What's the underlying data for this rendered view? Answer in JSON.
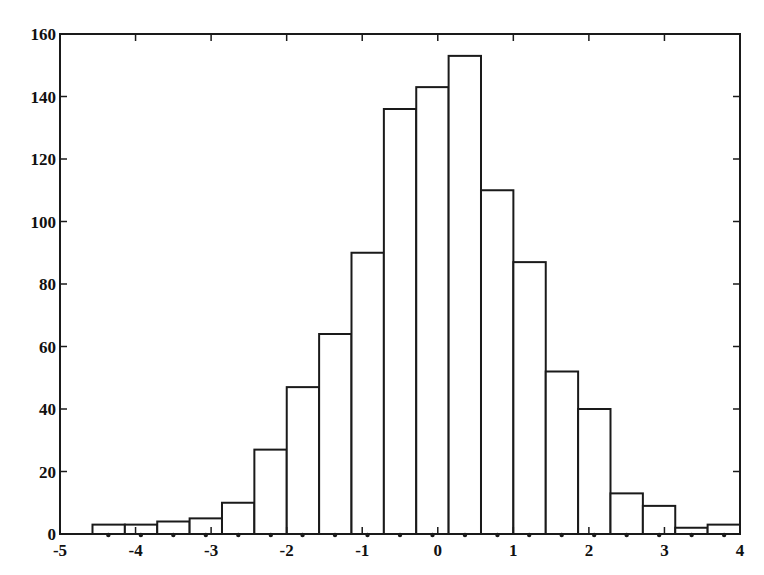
{
  "chart_data": {
    "type": "bar",
    "subtype": "histogram",
    "title": "",
    "xlabel": "",
    "ylabel": "",
    "xlim": [
      -5,
      4
    ],
    "ylim": [
      0,
      160
    ],
    "grid": false,
    "legend": null,
    "bin_start": -4.57,
    "bin_width": 0.4285,
    "bin_centers": [
      -4.36,
      -3.93,
      -3.5,
      -3.07,
      -2.64,
      -2.21,
      -1.79,
      -1.36,
      -0.93,
      -0.5,
      -0.07,
      0.36,
      0.79,
      1.21,
      1.64,
      2.07,
      2.5,
      2.93,
      3.36,
      3.79
    ],
    "values": [
      3,
      3,
      4,
      5,
      10,
      27,
      47,
      64,
      90,
      136,
      143,
      153,
      110,
      87,
      52,
      40,
      13,
      9,
      2,
      3
    ],
    "x_ticks": [
      "-5",
      "-4",
      "-3",
      "-2",
      "-1",
      "0",
      "1",
      "2",
      "3",
      "4"
    ],
    "x_tick_values": [
      -5,
      -4,
      -3,
      -2,
      -1,
      0,
      1,
      2,
      3,
      4
    ],
    "y_ticks": [
      "0",
      "20",
      "40",
      "60",
      "80",
      "100",
      "120",
      "140",
      "160"
    ],
    "y_tick_values": [
      0,
      20,
      40,
      60,
      80,
      100,
      120,
      140,
      160
    ],
    "bar_fill": "#ffffff",
    "bar_edge": "#1a1a1a"
  }
}
